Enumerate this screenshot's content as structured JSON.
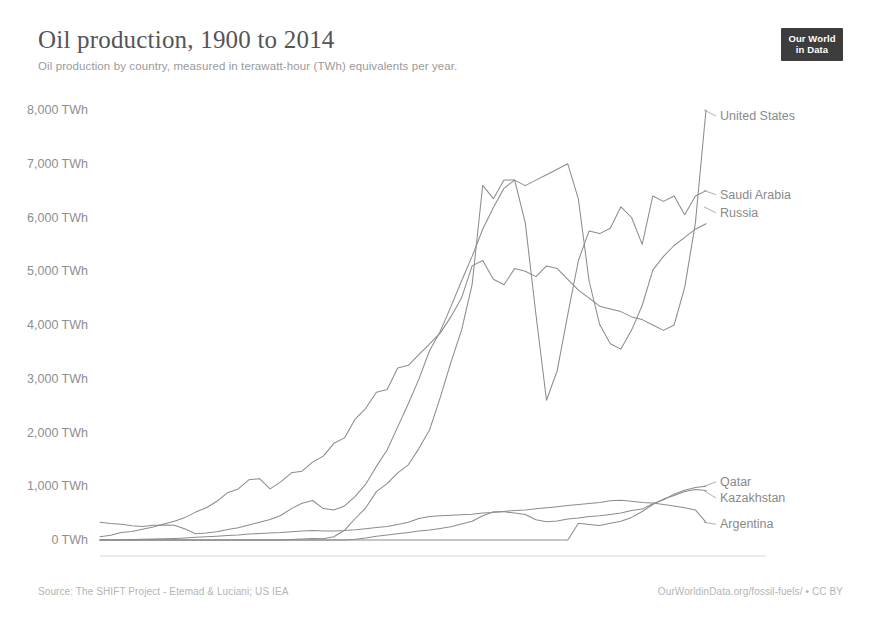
{
  "header": {
    "title": "Oil production, 1900 to 2014",
    "subtitle": "Oil production by country, measured in terawatt-hour (TWh) equivalents per year.",
    "logo_line1": "Our World",
    "logo_line2": "in Data"
  },
  "footer": {
    "source": "Source: The SHIFT Project - Etemad & Luciani; US IEA",
    "link": "OurWorldinData.org/fossil-fuels/ • CC BY"
  },
  "colors": {
    "background": "#ffffff",
    "line": "#8c8c8c",
    "axis_text": "#8e8e8e",
    "title": "#555555",
    "subtitle": "#9a9a9a",
    "footer": "#b4b4b4",
    "logo_background": "#3d3d3d"
  },
  "chart_data": {
    "type": "line",
    "title": "Oil production, 1900 to 2014",
    "subtitle": "Oil production by country, measured in terawatt-hour (TWh) equivalents per year.",
    "xlabel": "",
    "ylabel": "",
    "unit": "TWh",
    "xlim": [
      1900,
      2014
    ],
    "ylim": [
      0,
      8000
    ],
    "grid": false,
    "legend_position": "right-inline-labels",
    "x_ticks": [
      1900,
      1920,
      1940,
      1960,
      1980,
      2000,
      2014
    ],
    "x_tick_labels": [
      "1900",
      "1920",
      "1940",
      "1960",
      "1980",
      "2000",
      "2014"
    ],
    "y_ticks": [
      0,
      1000,
      2000,
      3000,
      4000,
      5000,
      6000,
      7000,
      8000
    ],
    "y_tick_labels": [
      "0 TWh",
      "1,000 TWh",
      "2,000 TWh",
      "3,000 TWh",
      "4,000 TWh",
      "5,000 TWh",
      "6,000 TWh",
      "7,000 TWh",
      "8,000 TWh"
    ],
    "x": [
      1900,
      1902,
      1904,
      1906,
      1908,
      1910,
      1912,
      1914,
      1916,
      1918,
      1920,
      1922,
      1924,
      1926,
      1928,
      1930,
      1932,
      1934,
      1936,
      1938,
      1940,
      1942,
      1944,
      1946,
      1948,
      1950,
      1952,
      1954,
      1956,
      1958,
      1960,
      1962,
      1964,
      1966,
      1968,
      1970,
      1972,
      1974,
      1976,
      1978,
      1980,
      1982,
      1984,
      1986,
      1988,
      1990,
      1992,
      1994,
      1996,
      1998,
      2000,
      2002,
      2004,
      2006,
      2008,
      2010,
      2012,
      2014
    ],
    "series": [
      {
        "name": "United States",
        "label": "United States",
        "end_value": 8000,
        "values": [
          60,
          90,
          140,
          160,
          200,
          240,
          300,
          350,
          420,
          520,
          600,
          720,
          880,
          950,
          1120,
          1140,
          950,
          1080,
          1250,
          1280,
          1450,
          1560,
          1800,
          1900,
          2250,
          2450,
          2750,
          2800,
          3200,
          3250,
          3450,
          3650,
          3850,
          4150,
          4500,
          5100,
          5200,
          4850,
          4750,
          5050,
          5000,
          4900,
          5100,
          5050,
          4850,
          4650,
          4500,
          4350,
          4300,
          4250,
          4150,
          4100,
          4000,
          3900,
          4000,
          4700,
          5900,
          8000
        ]
      },
      {
        "name": "Saudi Arabia",
        "label": "Saudi Arabia",
        "end_value": 6500,
        "values": [
          0,
          0,
          0,
          0,
          0,
          0,
          0,
          0,
          0,
          0,
          0,
          0,
          0,
          0,
          0,
          0,
          0,
          0,
          10,
          20,
          30,
          25,
          60,
          180,
          400,
          600,
          900,
          1050,
          1250,
          1400,
          1700,
          2050,
          2650,
          3300,
          3900,
          4750,
          6600,
          6350,
          6700,
          6700,
          5900,
          4200,
          2600,
          3150,
          4200,
          5200,
          5750,
          5700,
          5800,
          6200,
          6000,
          5500,
          6400,
          6300,
          6400,
          6050,
          6400,
          6500
        ]
      },
      {
        "name": "Russia",
        "label": "Russia",
        "end_value": 6200,
        "values": [
          650,
          600,
          580,
          520,
          500,
          540,
          550,
          540,
          400,
          230,
          260,
          300,
          380,
          450,
          550,
          650,
          750,
          900,
          1150,
          1350,
          1450,
          1150,
          1100,
          1250,
          1600,
          2050,
          2700,
          3300,
          4150,
          5000,
          5900,
          6950,
          7650,
          8550,
          9500,
          10400,
          11400,
          12200,
          12900,
          13200,
          13000,
          13200,
          13400,
          13600,
          13800,
          12500,
          9500,
          7900,
          7200,
          7000,
          7700,
          8600,
          9900,
          10400,
          10800,
          11100,
          11400,
          11600
        ]
      },
      {
        "name": "Qatar",
        "label": "Qatar",
        "end_value": 1000,
        "values": [
          0,
          0,
          0,
          0,
          0,
          0,
          0,
          0,
          0,
          0,
          0,
          0,
          0,
          0,
          0,
          0,
          0,
          0,
          0,
          0,
          0,
          0,
          0,
          0,
          30,
          80,
          140,
          190,
          230,
          280,
          330,
          370,
          430,
          490,
          600,
          700,
          900,
          1050,
          1050,
          1000,
          950,
          750,
          680,
          710,
          780,
          820,
          880,
          900,
          950,
          1000,
          1100,
          1150,
          1350,
          1500,
          1700,
          1850,
          1950,
          2000
        ]
      },
      {
        "name": "Kazakhstan",
        "label": "Kazakhstan",
        "end_value": 920,
        "values": [
          0,
          0,
          0,
          0,
          0,
          0,
          0,
          0,
          0,
          0,
          0,
          0,
          0,
          0,
          0,
          0,
          0,
          0,
          0,
          0,
          0,
          0,
          0,
          0,
          0,
          0,
          0,
          0,
          0,
          0,
          0,
          0,
          0,
          0,
          0,
          0,
          0,
          0,
          0,
          0,
          0,
          0,
          0,
          0,
          0,
          310,
          290,
          270,
          310,
          350,
          420,
          530,
          660,
          760,
          830,
          900,
          940,
          920
        ]
      },
      {
        "name": "Argentina",
        "label": "Argentina",
        "end_value": 330,
        "values": [
          0,
          0,
          5,
          10,
          15,
          20,
          25,
          30,
          40,
          50,
          60,
          70,
          85,
          95,
          110,
          120,
          130,
          140,
          155,
          165,
          175,
          170,
          165,
          175,
          190,
          210,
          230,
          250,
          290,
          330,
          400,
          440,
          450,
          460,
          470,
          480,
          500,
          510,
          530,
          550,
          560,
          580,
          600,
          620,
          640,
          660,
          680,
          700,
          730,
          740,
          720,
          700,
          690,
          660,
          630,
          600,
          560,
          330
        ]
      }
    ]
  },
  "plot_geometry": {
    "left": 100,
    "right": 706,
    "top": 24,
    "bottom": 454
  }
}
